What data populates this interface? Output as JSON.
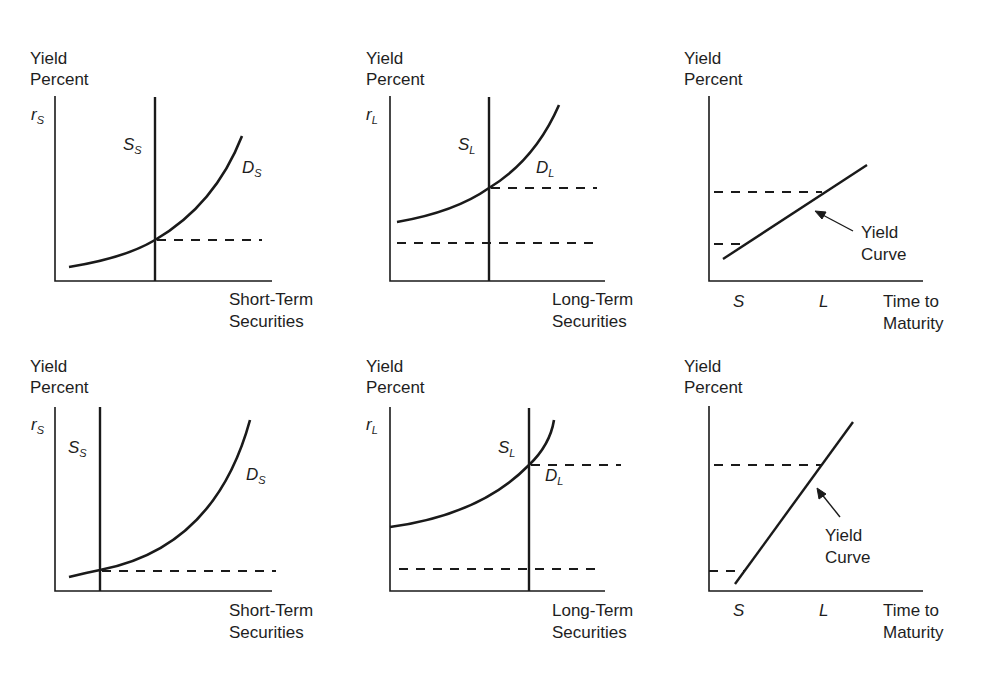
{
  "figure": {
    "panels": [
      {
        "id": "short-term-market-top",
        "y_label": [
          "Yield",
          "Percent"
        ],
        "y_symbol": {
          "base": "r",
          "sub": "S"
        },
        "supply_label": {
          "base": "S",
          "sub": "S"
        },
        "demand_label": {
          "base": "D",
          "sub": "S"
        },
        "x_label": [
          "Short-Term",
          "Securities"
        ]
      },
      {
        "id": "long-term-market-top",
        "y_label": [
          "Yield",
          "Percent"
        ],
        "y_symbol": {
          "base": "r",
          "sub": "L"
        },
        "supply_label": {
          "base": "S",
          "sub": "L"
        },
        "demand_label": {
          "base": "D",
          "sub": "L"
        },
        "x_label": [
          "Long-Term",
          "Securities"
        ]
      },
      {
        "id": "yield-curve-top",
        "y_label": [
          "Yield",
          "Percent"
        ],
        "annotation": [
          "Yield",
          "Curve"
        ],
        "x_ticks": [
          "S",
          "L"
        ],
        "x_label": [
          "Time to",
          "Maturity"
        ]
      },
      {
        "id": "short-term-market-bottom",
        "y_label": [
          "Yield",
          "Percent"
        ],
        "y_symbol": {
          "base": "r",
          "sub": "S"
        },
        "supply_label": {
          "base": "S",
          "sub": "S"
        },
        "demand_label": {
          "base": "D",
          "sub": "S"
        },
        "x_label": [
          "Short-Term",
          "Securities"
        ]
      },
      {
        "id": "long-term-market-bottom",
        "y_label": [
          "Yield",
          "Percent"
        ],
        "y_symbol": {
          "base": "r",
          "sub": "L"
        },
        "supply_label": {
          "base": "S",
          "sub": "L"
        },
        "demand_label": {
          "base": "D",
          "sub": "L"
        },
        "x_label": [
          "Long-Term",
          "Securities"
        ]
      },
      {
        "id": "yield-curve-bottom",
        "y_label": [
          "Yield",
          "Percent"
        ],
        "annotation": [
          "Yield",
          "Curve"
        ],
        "x_ticks": [
          "S",
          "L"
        ],
        "x_label": [
          "Time to",
          "Maturity"
        ]
      }
    ],
    "colors": {
      "ink": "#1a1a1a",
      "background": "#ffffff"
    }
  }
}
